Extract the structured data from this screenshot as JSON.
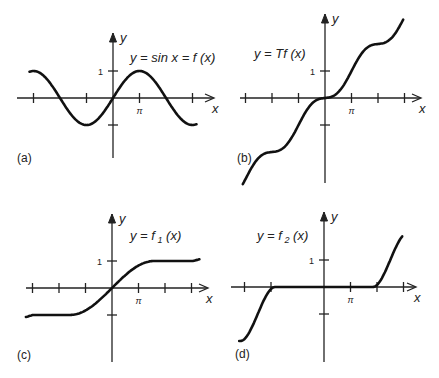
{
  "figure": {
    "panels": [
      {
        "id": "a",
        "panel_label": "(a)",
        "equation": "y = sin x = f (x)",
        "axis_x_label": "x",
        "axis_y_label": "y",
        "y_tick_label": "1",
        "x_tick_label": "π",
        "origin": [
          113,
          98
        ],
        "unit_x": 26.5,
        "unit_y": 27,
        "x_axis_range": [
          17,
          213
        ],
        "y_axis_range": [
          33,
          158
        ],
        "x_ticks": [
          -3,
          -1,
          1,
          3
        ],
        "label_pos": [
          17,
          162
        ],
        "eq_pos": [
          130,
          62
        ],
        "kind": "sin"
      },
      {
        "id": "b",
        "panel_label": "(b)",
        "equation": "y = Tf (x)",
        "axis_x_label": "x",
        "axis_y_label": "y",
        "y_tick_label": "1",
        "x_tick_label": "π",
        "origin": [
          325,
          98
        ],
        "unit_x": 26.5,
        "unit_y": 27,
        "x_axis_range": [
          240,
          420
        ],
        "y_axis_range": [
          14,
          183
        ],
        "x_ticks": [
          -3,
          -2,
          -1,
          1,
          2,
          3
        ],
        "label_pos": [
          237,
          162
        ],
        "eq_pos": [
          254,
          58
        ],
        "kind": "Tf"
      },
      {
        "id": "c",
        "panel_label": "(c)",
        "equation": "y = f",
        "equation_sub": "1",
        "equation_tail": "(x)",
        "axis_x_label": "x",
        "axis_y_label": "y",
        "y_tick_label": "1",
        "x_tick_label": "π",
        "origin": [
          112,
          288
        ],
        "unit_x": 26.5,
        "unit_y": 27,
        "x_axis_range": [
          26,
          207
        ],
        "y_axis_range": [
          214,
          362
        ],
        "x_ticks": [
          -3,
          -2,
          -1,
          1,
          2,
          3
        ],
        "label_pos": [
          17,
          359
        ],
        "eq_pos": [
          130,
          240
        ],
        "kind": "f1"
      },
      {
        "id": "d",
        "panel_label": "(d)",
        "equation": "y = f",
        "equation_sub": "2",
        "equation_tail": "(x)",
        "axis_x_label": "x",
        "axis_y_label": "y",
        "y_tick_label": "1",
        "x_tick_label": "π",
        "origin": [
          324,
          287
        ],
        "unit_x": 26.5,
        "unit_y": 27,
        "x_axis_range": [
          231,
          415
        ],
        "y_axis_range": [
          212,
          362
        ],
        "x_ticks": [
          -3,
          -2,
          1,
          2,
          3
        ],
        "label_pos": [
          235,
          358
        ],
        "eq_pos": [
          257,
          240
        ],
        "kind": "f2"
      }
    ]
  },
  "chart_data": [
    {
      "type": "line",
      "title": "y = sin x = f (x)",
      "panel": "(a)",
      "xlabel": "x",
      "ylabel": "y",
      "x_tick_labels": [
        "π"
      ],
      "y_tick_labels": [
        "1"
      ],
      "series": [
        {
          "name": "sin x",
          "x": [
            -3.14,
            -1.57,
            0,
            1.57,
            3.14
          ],
          "values": [
            0,
            -1,
            0,
            1,
            0
          ]
        }
      ],
      "ylim": [
        -1,
        1
      ],
      "grid": false
    },
    {
      "type": "line",
      "title": "y = Tf (x)",
      "panel": "(b)",
      "xlabel": "x",
      "ylabel": "y",
      "x_tick_labels": [
        "π"
      ],
      "y_tick_labels": [
        "1"
      ],
      "series": [
        {
          "name": "Tf(x)",
          "x": [
            -3,
            -2,
            -1,
            0,
            1,
            2,
            3
          ],
          "values": [
            -2.8,
            -2,
            -1,
            0,
            1,
            2,
            2.8
          ]
        }
      ],
      "grid": false
    },
    {
      "type": "line",
      "title": "y = f1 (x)",
      "panel": "(c)",
      "xlabel": "x",
      "ylabel": "y",
      "x_tick_labels": [
        "π"
      ],
      "y_tick_labels": [
        "1"
      ],
      "series": [
        {
          "name": "f1(x)",
          "x": [
            -3,
            -1,
            0,
            1,
            3
          ],
          "values": [
            -1,
            -1,
            0,
            1,
            1
          ]
        }
      ],
      "grid": false
    },
    {
      "type": "line",
      "title": "y = f2 (x)",
      "panel": "(d)",
      "xlabel": "x",
      "ylabel": "y",
      "x_tick_labels": [
        "π"
      ],
      "y_tick_labels": [
        "1"
      ],
      "series": [
        {
          "name": "f2(x)",
          "x": [
            -3,
            -2,
            -1,
            0,
            1,
            2,
            3
          ],
          "values": [
            -2,
            -1,
            0,
            0,
            0,
            1,
            2
          ]
        }
      ],
      "grid": false
    }
  ]
}
